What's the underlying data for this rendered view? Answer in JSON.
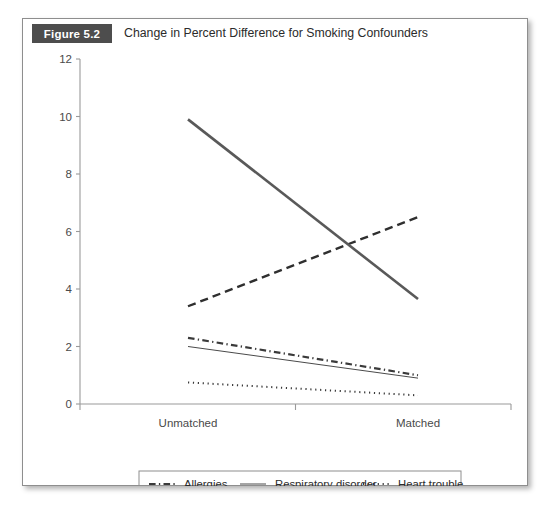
{
  "figure": {
    "badge": "Figure 5.2",
    "title": "Change in Percent Difference for Smoking Confounders"
  },
  "chart_data": {
    "type": "line",
    "title": "Change in Percent Difference for Smoking Confounders",
    "xlabel": "",
    "ylabel": "",
    "categories": [
      "Unmatched",
      "Matched"
    ],
    "x": [
      0,
      1
    ],
    "ylim": [
      0,
      12
    ],
    "yticks": [
      0,
      2,
      4,
      6,
      8,
      10,
      12
    ],
    "ytick_labels": [
      "0",
      "2",
      "4",
      "6",
      "8",
      "10",
      "12"
    ],
    "grid": false,
    "legend_position": "bottom",
    "series": [
      {
        "name": "Allergies",
        "style": "dashdot",
        "width": 2.2,
        "color": "#3a3a3a",
        "values": [
          2.3,
          1.0
        ]
      },
      {
        "name": "Respiratory disorder",
        "style": "solid",
        "width": 1.0,
        "color": "#4a4a4a",
        "values": [
          2.0,
          0.9
        ]
      },
      {
        "name": "Heart trouble",
        "style": "dotted",
        "width": 2.0,
        "color": "#3a3a3a",
        "values": [
          0.75,
          0.3
        ]
      },
      {
        "name": "Measles",
        "style": "dashed",
        "width": 2.4,
        "color": "#2f2f2f",
        "values": [
          3.4,
          6.5
        ]
      },
      {
        "name": "Childhood smoking",
        "style": "solid",
        "width": 2.6,
        "color": "#595959",
        "values": [
          9.9,
          3.65
        ]
      }
    ],
    "legend": [
      {
        "label": "Allergies",
        "style": "dashdot",
        "row": 0,
        "col": 0
      },
      {
        "label": "Respiratory disorder",
        "style": "solid",
        "row": 0,
        "col": 1
      },
      {
        "label": "Heart trouble",
        "style": "dotted",
        "row": 0,
        "col": 2
      },
      {
        "label": "Measles",
        "style": "dashed",
        "row": 1,
        "col": 0
      },
      {
        "label": "Childhood smoking",
        "style": "solid",
        "row": 1,
        "col": 1
      }
    ]
  },
  "colors": {
    "badge_bg": "#4d4d4d",
    "card_border": "#8e8e8e",
    "axis": "#9a9a9a",
    "text": "#4a4a4a"
  }
}
